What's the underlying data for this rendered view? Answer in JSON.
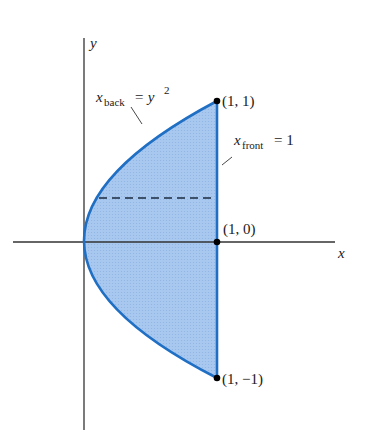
{
  "figure": {
    "axes": {
      "x_label": "x",
      "y_label": "y"
    },
    "curves": {
      "back": {
        "var": "x",
        "sub": "back",
        "rhs_base": "= y",
        "rhs_exp": "2"
      },
      "front": {
        "var": "x",
        "sub": "front",
        "rhs": "= 1"
      }
    },
    "points": [
      {
        "label": "(1, 1)",
        "x": 1,
        "y": 1
      },
      {
        "label": "(1, 0)",
        "x": 1,
        "y": 0
      },
      {
        "label": "(1, −1)",
        "x": 1,
        "y": -1
      }
    ],
    "colors": {
      "region_fill": "#a9c8ef",
      "boundary": "#1f6fc4",
      "axis": "#333333",
      "dashed_strip": "#1a2a40",
      "point": "#000000"
    }
  }
}
